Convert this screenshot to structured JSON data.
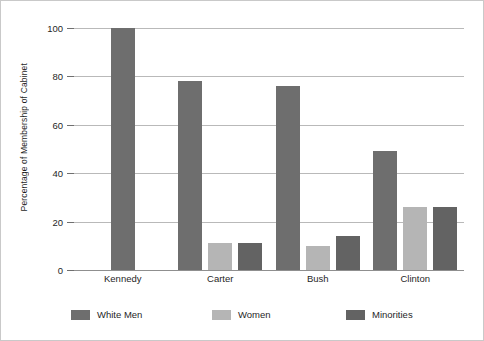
{
  "chart_data": {
    "type": "bar",
    "title": "",
    "xlabel": "",
    "ylabel": "Percentage of Membership of Cabinet",
    "ylim": [
      0,
      100
    ],
    "yticks": [
      0,
      20,
      40,
      60,
      80,
      100
    ],
    "ytick_labels": [
      "0",
      "20",
      "40",
      "60",
      "80",
      "100"
    ],
    "grid": true,
    "legend_position": "bottom",
    "categories": [
      "Kennedy",
      "Carter",
      "Bush",
      "Clinton"
    ],
    "series": [
      {
        "name": "White Men",
        "color": "#6e6e6e",
        "values": [
          100,
          78,
          76,
          49
        ]
      },
      {
        "name": "Women",
        "color": "#b5b5b5",
        "values": [
          null,
          11,
          10,
          26
        ]
      },
      {
        "name": "Minorities",
        "color": "#636363",
        "values": [
          null,
          11,
          14,
          26
        ]
      }
    ]
  },
  "colors": {
    "white_men": "#6e6e6e",
    "women": "#b5b5b5",
    "minorities": "#636363",
    "gridline": "#b9b9b9",
    "axis": "#8f8f8f",
    "border": "#c9c9c9",
    "background": "#ffffff",
    "text": "#1f1f1f"
  }
}
